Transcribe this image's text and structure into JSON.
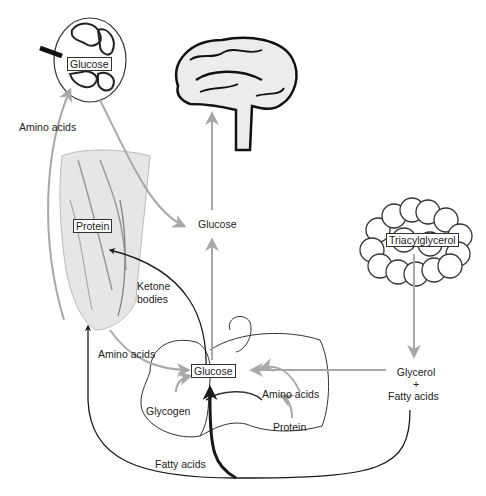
{
  "diagram": {
    "organs": [
      "kidney",
      "brain",
      "muscle",
      "adipose-tissue",
      "liver"
    ],
    "labels": {
      "kidney_glucose": "Glucose",
      "amino_acids_top": "Amino acids",
      "brain_glucose": "Glucose",
      "muscle_protein": "Protein",
      "ketone_bodies_1": "Ketone",
      "ketone_bodies_2": "bodies",
      "triacylglycerol": "Triacylglycerol",
      "amino_acids_mid": "Amino acids",
      "liver_glucose": "Glucose",
      "liver_amino_acids": "Amino acids",
      "glycogen": "Glycogen",
      "liver_protein": "Protein",
      "glycerol": "Glycerol",
      "plus": "+",
      "fatty_acids_right": "Fatty acids",
      "fatty_acids_bottom": "Fatty acids"
    },
    "colors": {
      "gray_arrow": "#a8a8a8",
      "black_line": "#1a1a1a",
      "organ_fill": "#e6e6e6",
      "outline": "#333333"
    }
  }
}
